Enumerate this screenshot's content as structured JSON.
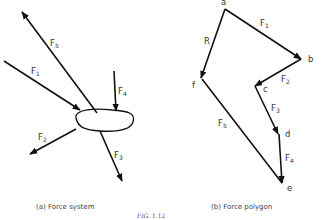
{
  "figure": {
    "label": "FIG. 1.12",
    "panel_a": {
      "caption": "(a) Force system",
      "forces": [
        {
          "name": "F",
          "sub": "1"
        },
        {
          "name": "F",
          "sub": "2"
        },
        {
          "name": "F",
          "sub": "3"
        },
        {
          "name": "F",
          "sub": "4"
        },
        {
          "name": "F",
          "sub": "5"
        }
      ]
    },
    "panel_b": {
      "caption": "(b) Force polygon",
      "points": [
        "a",
        "b",
        "c",
        "d",
        "e",
        "f"
      ],
      "edges": [
        {
          "name": "F",
          "sub": "1",
          "from": "a",
          "to": "b"
        },
        {
          "name": "F",
          "sub": "2",
          "from": "b",
          "to": "c"
        },
        {
          "name": "F",
          "sub": "3",
          "from": "c",
          "to": "d"
        },
        {
          "name": "F",
          "sub": "4",
          "from": "d",
          "to": "e"
        },
        {
          "name": "F",
          "sub": "5",
          "from": "e",
          "to": "f"
        },
        {
          "name": "R",
          "sub": "",
          "from": "a",
          "to": "f"
        }
      ]
    }
  }
}
